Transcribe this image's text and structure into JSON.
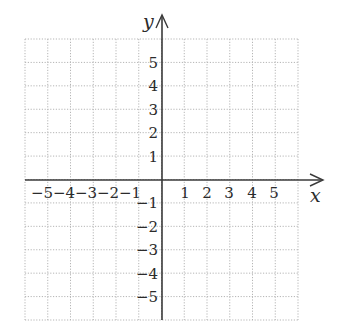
{
  "figure": {
    "type": "coordinate-plane",
    "x_axis_label": "x",
    "y_axis_label": "y",
    "x_range": [
      -6,
      6
    ],
    "y_range": [
      -6,
      6
    ],
    "grid_step": 1,
    "grid_style": "dotted",
    "x_tick_labels": [
      "−5",
      "−4",
      "−3",
      "−2",
      "−1",
      "1",
      "2",
      "3",
      "4",
      "5"
    ],
    "y_tick_labels": [
      "5",
      "4",
      "3",
      "2",
      "1",
      "−1",
      "−2",
      "−3",
      "−4",
      "−5"
    ],
    "colors": {
      "axis": "#3a3a3a",
      "grid": "#b5b5b5",
      "text": "#2b2b2b"
    }
  }
}
